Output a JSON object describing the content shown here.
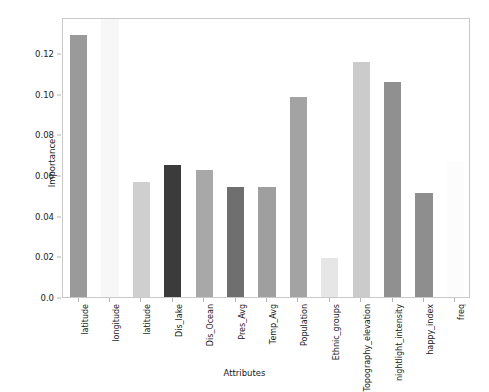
{
  "chart_data": {
    "type": "bar",
    "title": "",
    "xlabel": "Attributes",
    "ylabel": "Importance",
    "categories": [
      "latitude",
      "longitude",
      "latitude",
      "Dis_lake",
      "Dis_Ocean",
      "Pres_Avg",
      "Temp_Avg",
      "Population",
      "Ethnic_groups",
      "Topography_elevation",
      "nightlight_intensity",
      "happy_index",
      "freq"
    ],
    "values": [
      0.1287,
      0.1366,
      0.0565,
      0.0649,
      0.0624,
      0.0541,
      0.0541,
      0.0983,
      0.0192,
      0.1156,
      0.1055,
      0.0511,
      0.0663
    ],
    "bar_colors": [
      "#9a9a9a",
      "#f7f7f7",
      "#cfcfcf",
      "#3b3b3b",
      "#a8a8a8",
      "#6f6f6f",
      "#9f9f9f",
      "#a3a3a3",
      "#e6e6e6",
      "#cbcbcb",
      "#909090",
      "#8e8e8e",
      "#fcfcfc"
    ],
    "ylim": [
      0.0,
      0.1376
    ],
    "xlim": [
      -0.6,
      12.6
    ],
    "ytick_labels": [
      "0.0",
      "0.02",
      "0.04",
      "0.06",
      "0.08",
      "0.10",
      "0.12"
    ],
    "ytick_values": [
      0.0,
      0.02,
      0.04,
      0.06,
      0.08,
      0.1,
      0.12
    ],
    "grid": false,
    "legend": null,
    "frame_color": "#c9c9c9",
    "background": "#ffffff"
  }
}
